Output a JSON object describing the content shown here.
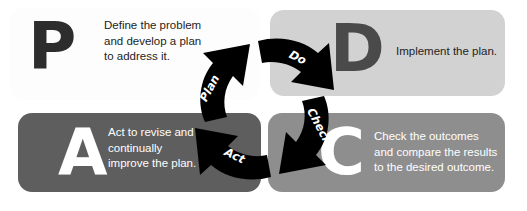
{
  "diagram": {
    "type": "pdca-cycle",
    "colors": {
      "panel_plan_bg": "#fdfdfd",
      "panel_do_bg": "#d2d2d2",
      "panel_act_bg": "#5e5e5e",
      "panel_check_bg": "#8e8e8e",
      "letter_plan": "#2d2d2d",
      "letter_do": "#4a4a4a",
      "letter_act": "#ffffff",
      "letter_check": "#ffffff",
      "arrow_fill": "#000000",
      "arrow_label": "#ffffff",
      "page_bg": "#ffffff"
    }
  },
  "quadrants": {
    "plan": {
      "letter": "P",
      "text": "Define the problem\nand develop a plan\nto address it."
    },
    "do": {
      "letter": "D",
      "text": "Implement the plan."
    },
    "act": {
      "letter": "A",
      "text": "Act to revise and\ncontinually\nimprove the plan."
    },
    "check": {
      "letter": "C",
      "text": "Check the outcomes\nand compare the results\nto the desired outcome."
    }
  },
  "arrows": {
    "plan_label": "Plan",
    "do_label": "Do",
    "check_label": "Check",
    "act_label": "Act"
  }
}
